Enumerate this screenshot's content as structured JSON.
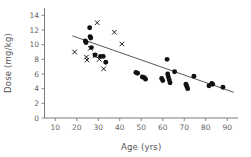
{
  "chart_data": {
    "type": "scatter",
    "title": "",
    "xlabel": "Age (yrs)",
    "ylabel": "Dose (mg/kg)",
    "xlim": [
      5,
      95
    ],
    "ylim": [
      0,
      15
    ],
    "xticks": [
      10,
      20,
      30,
      40,
      50,
      60,
      70,
      80,
      90
    ],
    "xticklabels": [
      "10",
      "20",
      "30",
      "40",
      "50",
      "60",
      "70",
      "80",
      "90"
    ],
    "yticks": [
      0,
      2,
      4,
      6,
      8,
      10,
      12,
      14
    ],
    "yticklabels": [
      "0",
      "2",
      "4",
      "6",
      "8",
      "10",
      "12",
      "14"
    ],
    "grid": false,
    "legend": "none",
    "marker_colors": {
      "circle": "#111111",
      "cross": "#111111",
      "trendline": "#3a3a3a",
      "axis": "#6b6b6b"
    },
    "series": [
      {
        "name": "filled-circle",
        "marker": "circle",
        "points": [
          [
            24.0,
            10.5
          ],
          [
            24.3,
            10.3
          ],
          [
            26.0,
            12.3
          ],
          [
            26.2,
            11.1
          ],
          [
            26.5,
            10.9
          ],
          [
            26.8,
            9.6
          ],
          [
            28.5,
            8.6
          ],
          [
            31.0,
            8.4
          ],
          [
            32.3,
            8.4
          ],
          [
            33.5,
            7.6
          ],
          [
            47.5,
            6.2
          ],
          [
            48.3,
            6.1
          ],
          [
            50.5,
            5.6
          ],
          [
            51.5,
            5.5
          ],
          [
            52.0,
            5.3
          ],
          [
            59.5,
            5.4
          ],
          [
            60.0,
            5.1
          ],
          [
            62.0,
            8.0
          ],
          [
            62.3,
            6.0
          ],
          [
            62.6,
            5.6
          ],
          [
            63.0,
            5.2
          ],
          [
            63.4,
            4.8
          ],
          [
            65.5,
            6.3
          ],
          [
            70.8,
            4.6
          ],
          [
            71.2,
            4.3
          ],
          [
            71.6,
            4.0
          ],
          [
            74.5,
            5.7
          ],
          [
            81.5,
            4.4
          ],
          [
            82.8,
            4.7
          ],
          [
            83.2,
            4.6
          ],
          [
            88.0,
            4.2
          ]
        ]
      },
      {
        "name": "cross",
        "marker": "x",
        "points": [
          [
            19.0,
            9.0
          ],
          [
            24.5,
            8.3
          ],
          [
            24.8,
            7.9
          ],
          [
            26.3,
            9.5
          ],
          [
            28.5,
            8.5
          ],
          [
            29.5,
            13.0
          ],
          [
            30.5,
            8.0
          ],
          [
            32.5,
            6.7
          ],
          [
            37.5,
            11.7
          ],
          [
            41.0,
            10.1
          ]
        ]
      }
    ],
    "trendline": {
      "x": [
        18,
        93
      ],
      "y": [
        11.2,
        3.5
      ]
    }
  }
}
